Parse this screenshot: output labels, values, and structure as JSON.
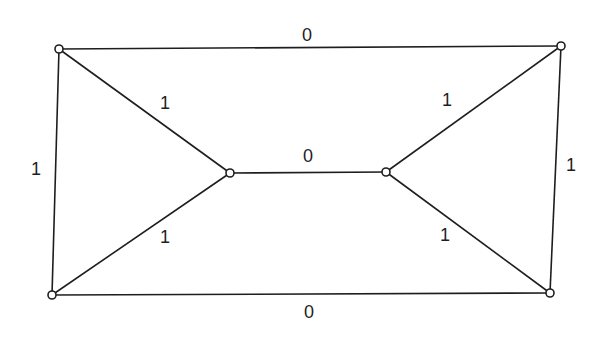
{
  "diagram": {
    "type": "weighted-graph",
    "colors": {
      "ink": "#1e1e1e",
      "background": "#ffffff"
    },
    "nodes": [
      {
        "id": "top-left",
        "x": 59,
        "y": 49
      },
      {
        "id": "top-right",
        "x": 561,
        "y": 46
      },
      {
        "id": "mid-left",
        "x": 230,
        "y": 173
      },
      {
        "id": "mid-right",
        "x": 386,
        "y": 172
      },
      {
        "id": "bottom-left",
        "x": 52,
        "y": 295
      },
      {
        "id": "bottom-right",
        "x": 550,
        "y": 293
      }
    ],
    "edges": [
      {
        "from": "top-left",
        "to": "top-right",
        "label": "0",
        "lx": 307,
        "ly": 36
      },
      {
        "from": "top-left",
        "to": "bottom-left",
        "label": "1",
        "lx": 36,
        "ly": 170
      },
      {
        "from": "top-left",
        "to": "mid-left",
        "label": "1",
        "lx": 165,
        "ly": 104
      },
      {
        "from": "bottom-left",
        "to": "mid-left",
        "label": "1",
        "lx": 165,
        "ly": 238
      },
      {
        "from": "mid-left",
        "to": "mid-right",
        "label": "0",
        "lx": 308,
        "ly": 157
      },
      {
        "from": "top-right",
        "to": "mid-right",
        "label": "1",
        "lx": 447,
        "ly": 101
      },
      {
        "from": "bottom-right",
        "to": "mid-right",
        "label": "1",
        "lx": 445,
        "ly": 236
      },
      {
        "from": "top-right",
        "to": "bottom-right",
        "label": "1",
        "lx": 571,
        "ly": 166
      },
      {
        "from": "bottom-left",
        "to": "bottom-right",
        "label": "0",
        "lx": 309,
        "ly": 313
      }
    ]
  }
}
